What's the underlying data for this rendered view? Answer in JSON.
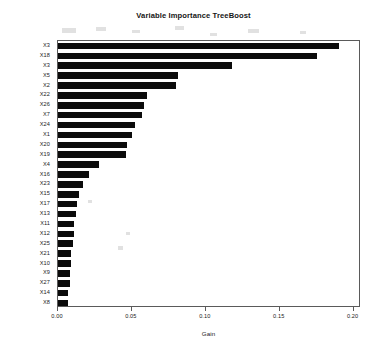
{
  "chart_data": {
    "type": "bar",
    "orientation": "horizontal",
    "title": "Variable Importance TreeBoost",
    "xlabel": "Gain",
    "ylabel": "",
    "xlim": [
      0.0,
      0.205
    ],
    "grid": false,
    "legend": null,
    "bar_color": "#0b0b0b",
    "xticks": [
      "0.00",
      "0.05",
      "0.10",
      "0.15",
      "0.20"
    ],
    "xtick_values": [
      0.0,
      0.05,
      0.1,
      0.15,
      0.2
    ],
    "categories": [
      "X3",
      "X18",
      "X3",
      "X5",
      "X2",
      "X22",
      "X26",
      "X7",
      "X24",
      "X1",
      "X20",
      "X19",
      "X4",
      "X16",
      "X23",
      "X15",
      "X17",
      "X13",
      "X11",
      "X12",
      "X25",
      "X21",
      "X10",
      "X9",
      "X27",
      "X14",
      "X8"
    ],
    "values": [
      0.19,
      0.175,
      0.118,
      0.081,
      0.08,
      0.06,
      0.058,
      0.057,
      0.052,
      0.05,
      0.047,
      0.046,
      0.028,
      0.021,
      0.017,
      0.014,
      0.013,
      0.012,
      0.011,
      0.011,
      0.01,
      0.009,
      0.009,
      0.008,
      0.008,
      0.007,
      0.007
    ]
  }
}
